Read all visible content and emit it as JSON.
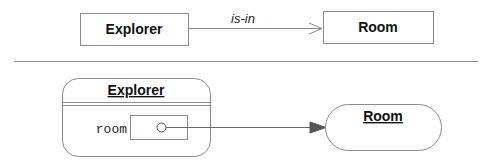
{
  "top_diagram": {
    "source": {
      "label": "Explorer"
    },
    "target": {
      "label": "Room"
    },
    "edge": {
      "label": "is-in"
    }
  },
  "bottom_diagram": {
    "object": {
      "title": "Explorer",
      "field": "room"
    },
    "target": {
      "title": "Room"
    }
  },
  "colors": {
    "stroke": "#8a8a8a",
    "arrow": "#555555",
    "text": "#111111"
  }
}
